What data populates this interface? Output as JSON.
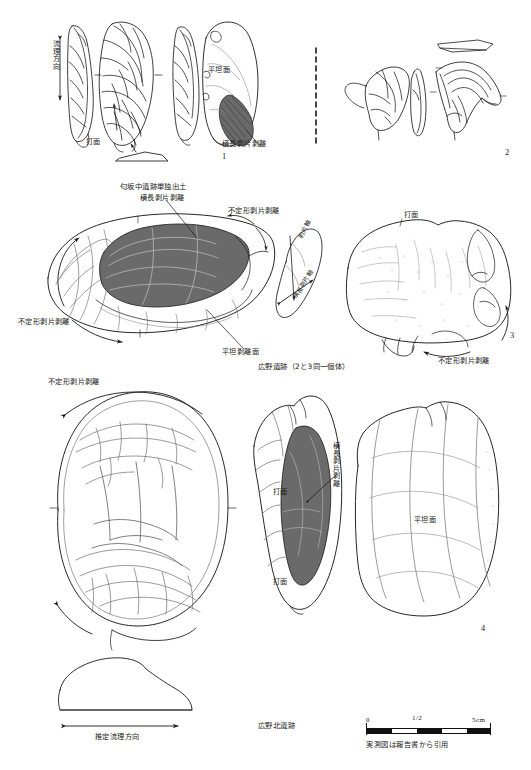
{
  "plate": {
    "title": "石器実測図集成",
    "background_color": "#ffffff",
    "ink_color": "#1a1a1a",
    "shade_fill_color": "#6a6a6a",
    "scale_divider": "dashed-vertical-divider"
  },
  "sections": {
    "top": {
      "site_caption": "",
      "labels": [
        {
          "id": "flow-direction",
          "text": "流理方向",
          "orientation": "vertical"
        },
        {
          "id": "striking-platform",
          "text": "打面",
          "orientation": "horizontal"
        },
        {
          "id": "flat-surface",
          "text": "平坦面",
          "orientation": "horizontal"
        },
        {
          "id": "transverse-flake-removal",
          "text": "横長剥片剥離",
          "orientation": "horizontal"
        }
      ],
      "figure_numbers": [
        "1",
        "2"
      ]
    },
    "middle": {
      "site_caption_top": "匂坂中遺跡単独出土",
      "site_caption_bottom": "広野遺跡（2と3同一個体）",
      "labels": [
        {
          "id": "transverse-flake-removal",
          "text": "横長剥片剥離",
          "orientation": "horizontal"
        },
        {
          "id": "irregular-flake-removal-right",
          "text": "不定形剥片剥離",
          "orientation": "horizontal"
        },
        {
          "id": "irregular-flake-removal-left",
          "text": "不定形剥片剥離",
          "orientation": "horizontal"
        },
        {
          "id": "flat-removal-surface",
          "text": "平坦剥離面",
          "orientation": "horizontal"
        },
        {
          "id": "flake-axis-tag-a",
          "text": "剥片軸",
          "orientation": "tilted"
        },
        {
          "id": "flake-axis-tag-b",
          "text": "横長剥片軸",
          "orientation": "tilted"
        },
        {
          "id": "striking-platform-right",
          "text": "打面",
          "orientation": "horizontal"
        },
        {
          "id": "irregular-flake-removal-bottom-right",
          "text": "不定形剥片剥離",
          "orientation": "horizontal"
        }
      ],
      "figure_numbers": [
        "3"
      ]
    },
    "bottom": {
      "site_caption": "広野北遺跡",
      "labels": [
        {
          "id": "irregular-flake-removal-top",
          "text": "不定形剥片剥離",
          "orientation": "horizontal"
        },
        {
          "id": "transverse-flake-removal-vertical",
          "text": "横長剥片剥離",
          "orientation": "vertical"
        },
        {
          "id": "striking-platform-upper",
          "text": "打面",
          "orientation": "horizontal"
        },
        {
          "id": "striking-platform-lower",
          "text": "打面",
          "orientation": "horizontal"
        },
        {
          "id": "flat-surface",
          "text": "平坦面",
          "orientation": "horizontal"
        },
        {
          "id": "estimated-flow-direction",
          "text": "推定流理方向",
          "orientation": "horizontal"
        }
      ],
      "figure_numbers": [
        "4"
      ]
    }
  },
  "scale": {
    "ticks": [
      "0",
      "1/2",
      "5cm"
    ],
    "note": "実測図は報告書から引用",
    "segments": 5,
    "unit": "cm"
  }
}
